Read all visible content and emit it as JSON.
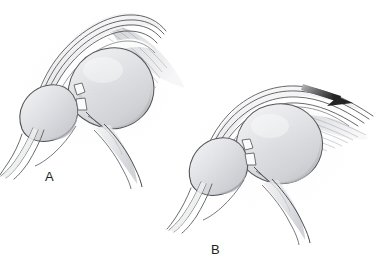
{
  "figure": {
    "type": "medical-illustration",
    "style": "grayscale-pencil-anatomical-drawing",
    "background_color": "#ffffff",
    "ink_color": "#3a3a3c",
    "bone_fill_color": "#d8d9dc",
    "soft_tissue_fill_color": "#e9eaec",
    "arrow_color": "#2b2b2d"
  },
  "panels": [
    {
      "id": "A",
      "label": "A",
      "description": "Shoulder joint in neutral resting position, humeral head centered on glenoid",
      "has_arrow": false
    },
    {
      "id": "B",
      "label": "B",
      "description": "Shoulder joint with superior translation of the humeral head, arrow shows direction of force",
      "has_arrow": true,
      "arrow_direction": "down-right"
    }
  ]
}
